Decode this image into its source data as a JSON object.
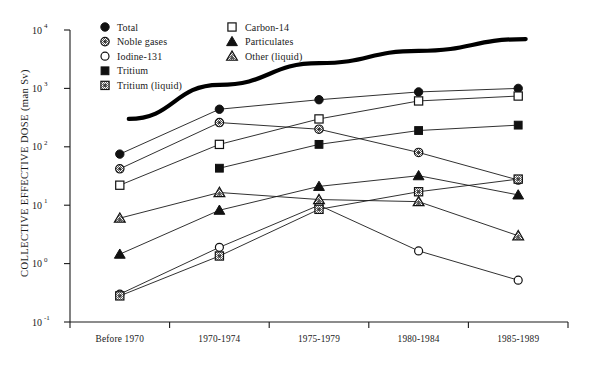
{
  "chart_data": {
    "type": "line",
    "title": "",
    "xlabel": "",
    "ylabel": "COLLECTIVE EFFECTIVE DOSE (man Sv)",
    "categories": [
      "Before  1970",
      "1970-1974",
      "1975-1979",
      "1980-1984",
      "1985-1989"
    ],
    "ylim": [
      0.1,
      10000
    ],
    "yscale": "log",
    "ytick_labels": [
      "10",
      "10",
      "10",
      "10",
      "10",
      "10"
    ],
    "ytick_exponents": [
      "4",
      "3",
      "2",
      "1",
      "0",
      "-1"
    ],
    "ytick_values": [
      10000,
      1000,
      100,
      10,
      1,
      0.1
    ],
    "grid": false,
    "legend_position": "top-left-inside",
    "series": [
      {
        "name": "Total",
        "marker": "filled-circle",
        "values": [
          75,
          440,
          640,
          870,
          1000
        ]
      },
      {
        "name": "Noble gases",
        "marker": "shaded-circle",
        "values": [
          42,
          260,
          200,
          80,
          27
        ]
      },
      {
        "name": "Iodine-131",
        "marker": "open-circle",
        "values": [
          0.3,
          1.9,
          10,
          1.65,
          0.52
        ]
      },
      {
        "name": "Tritium",
        "marker": "filled-square",
        "values": [
          null,
          43,
          110,
          190,
          235
        ]
      },
      {
        "name": "Tritium (liquid)",
        "marker": "hatched-square",
        "values": [
          0.28,
          1.35,
          8.5,
          17,
          28
        ]
      },
      {
        "name": "Carbon-14",
        "marker": "open-square",
        "values": [
          22,
          110,
          300,
          610,
          740
        ]
      },
      {
        "name": "Particulates",
        "marker": "filled-triangle",
        "values": [
          1.45,
          8.2,
          21,
          32,
          15
        ]
      },
      {
        "name": "Other (liquid)",
        "marker": "hatched-triangle",
        "values": [
          6.0,
          16.5,
          12.5,
          11.5,
          3.0
        ]
      }
    ],
    "envelope_curve": {
      "name": "total-collective-envelope",
      "style": "thick-solid",
      "points": [
        {
          "x_frac": 0.118,
          "value": 300
        },
        {
          "x_frac": 0.3,
          "value": 1150
        },
        {
          "x_frac": 0.5,
          "value": 2700
        },
        {
          "x_frac": 0.7,
          "value": 4400
        },
        {
          "x_frac": 0.915,
          "value": 7000
        }
      ]
    }
  },
  "legend": {
    "column1": [
      {
        "label": "Total",
        "marker": "filled-circle"
      },
      {
        "label": "Noble  gases",
        "marker": "shaded-circle"
      },
      {
        "label": "Iodine-131",
        "marker": "open-circle"
      },
      {
        "label": "Tritium",
        "marker": "filled-square"
      },
      {
        "label": "Tritium  (liquid)",
        "marker": "hatched-square"
      }
    ],
    "column2": [
      {
        "label": "Carbon-14",
        "marker": "open-square"
      },
      {
        "label": "Particulates",
        "marker": "filled-triangle"
      },
      {
        "label": "Other  (liquid)",
        "marker": "hatched-triangle"
      }
    ]
  },
  "colors": {
    "ink": "#1a1a1a",
    "background": "#ffffff",
    "marker_fill_dark": "#111111",
    "marker_fill_light": "#ffffff",
    "marker_shade": "#9a9a9a"
  }
}
